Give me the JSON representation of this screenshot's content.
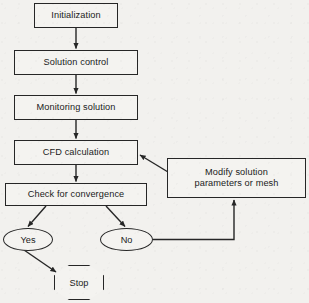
{
  "diagram": {
    "background_color": "#f2f1ee",
    "line_color": "#262626",
    "text_color": "#1b1b1b",
    "nodes": [
      {
        "id": "initialization",
        "label": "Initialization",
        "shape": "rectangle"
      },
      {
        "id": "solution_control",
        "label": "Solution control",
        "shape": "rectangle"
      },
      {
        "id": "monitoring_solution",
        "label": "Monitoring solution",
        "shape": "rectangle"
      },
      {
        "id": "cfd_calculation",
        "label": "CFD calculation",
        "shape": "rectangle"
      },
      {
        "id": "check_convergence",
        "label": "Check for convergence",
        "shape": "rectangle"
      },
      {
        "id": "modify_solution",
        "label": "Modify solution\nparameters or mesh",
        "shape": "rectangle"
      },
      {
        "id": "yes",
        "label": "Yes",
        "shape": "ellipse"
      },
      {
        "id": "no",
        "label": "No",
        "shape": "ellipse"
      },
      {
        "id": "stop",
        "label": "Stop",
        "shape": "octagon"
      }
    ],
    "edges": [
      {
        "from": "initialization",
        "to": "solution_control",
        "style": "straight-down"
      },
      {
        "from": "solution_control",
        "to": "monitoring_solution",
        "style": "straight-down"
      },
      {
        "from": "monitoring_solution",
        "to": "cfd_calculation",
        "style": "straight-down"
      },
      {
        "from": "cfd_calculation",
        "to": "check_convergence",
        "style": "straight-down"
      },
      {
        "from": "check_convergence",
        "to": "yes",
        "style": "diagonal-left"
      },
      {
        "from": "check_convergence",
        "to": "no",
        "style": "diagonal-right"
      },
      {
        "from": "yes",
        "to": "stop",
        "style": "diagonal-right"
      },
      {
        "from": "no",
        "to": "modify_solution",
        "style": "elbow-right-up"
      },
      {
        "from": "modify_solution",
        "to": "cfd_calculation",
        "style": "diagonal-up-left"
      }
    ]
  }
}
